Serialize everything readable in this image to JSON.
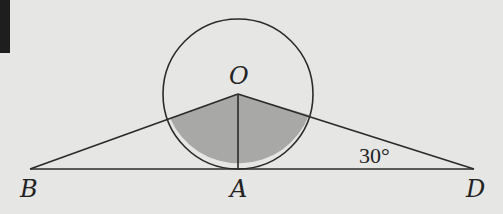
{
  "diagram": {
    "type": "geometry",
    "colors": {
      "background": "#e6e6e4",
      "stroke": "#2a2a2a",
      "shade": "#a8a8a6",
      "corner_block": "#1e1e1e"
    },
    "points": {
      "O": {
        "label": "O",
        "x": 238,
        "y": 94
      },
      "A": {
        "label": "A",
        "x": 238,
        "y": 169
      },
      "B": {
        "label": "B",
        "x": 30,
        "y": 169
      },
      "D": {
        "label": "D",
        "x": 474,
        "y": 169
      }
    },
    "circle": {
      "center": "O",
      "radius": 75
    },
    "segments": [
      "BD",
      "OB",
      "OD",
      "OA"
    ],
    "shaded_region": "sector of circle O bounded by OB and OD (below O)",
    "angle_annotation": {
      "vertex": "D",
      "text": "30°"
    }
  }
}
